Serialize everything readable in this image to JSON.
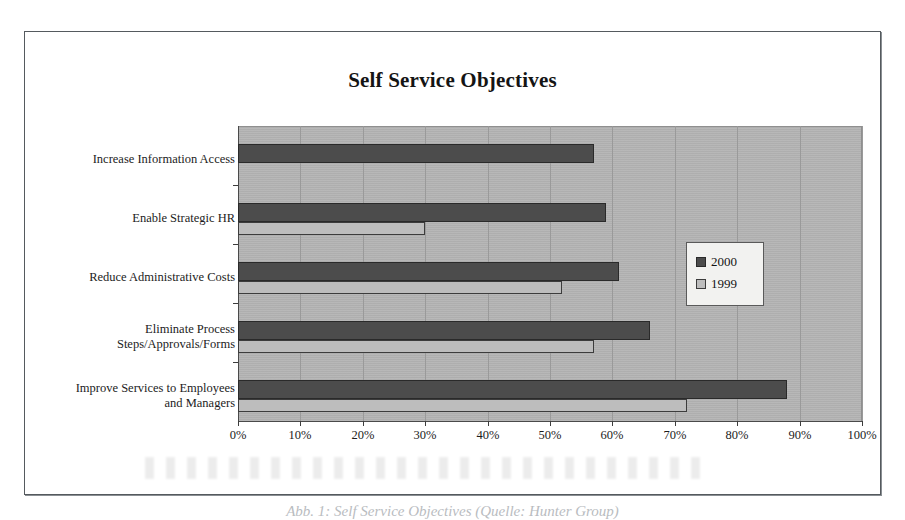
{
  "figure": {
    "caption": "Abb. 1: Self Service Objectives (Quelle: Hunter Group)"
  },
  "chart_data": {
    "type": "bar",
    "orientation": "horizontal",
    "title": "Self Service Objectives",
    "xlabel": "",
    "ylabel": "",
    "xlim": [
      0,
      100
    ],
    "xticks": [
      "0%",
      "10%",
      "20%",
      "30%",
      "40%",
      "50%",
      "60%",
      "70%",
      "80%",
      "90%",
      "100%"
    ],
    "xtick_values": [
      0,
      10,
      20,
      30,
      40,
      50,
      60,
      70,
      80,
      90,
      100
    ],
    "grid": true,
    "legend_position": "center-right",
    "categories": [
      "Increase Information Access",
      "Enable Strategic HR",
      "Reduce Administrative Costs",
      "Eliminate Process\nSteps/Approvals/Forms",
      "Improve Services to Employees\nand Managers"
    ],
    "category_lines": [
      [
        "Increase Information Access"
      ],
      [
        "Enable Strategic HR"
      ],
      [
        "Reduce Administrative Costs"
      ],
      [
        "Eliminate Process",
        "Steps/Approvals/Forms"
      ],
      [
        "Improve Services to Employees",
        "and Managers"
      ]
    ],
    "series": [
      {
        "name": "2000",
        "color": "#4c4c4c",
        "values": [
          57,
          59,
          61,
          66,
          88
        ]
      },
      {
        "name": "1999",
        "color": "#bdbdbd",
        "values": [
          null,
          30,
          52,
          57,
          72
        ]
      }
    ],
    "colors": {
      "series_2000": "#4c4c4c",
      "series_1999": "#bdbdbd",
      "plot_background": "#b4b4b4",
      "gridline": "#9a9a9a",
      "axis": "#4a4a4a",
      "text": "#1c1c1c"
    }
  },
  "legend": {
    "items": [
      {
        "label": "2000"
      },
      {
        "label": "1999"
      }
    ]
  }
}
